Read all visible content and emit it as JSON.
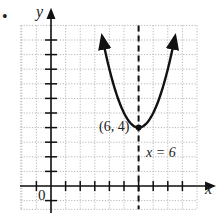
{
  "bullet": "•",
  "chart_data": {
    "type": "line",
    "title": "",
    "xlabel": "x",
    "ylabel": "y",
    "function": "y = (x - 6)^2 + 4",
    "series": [
      {
        "name": "parabola",
        "x": [
          3.5,
          4,
          4.5,
          5,
          5.5,
          6,
          6.5,
          7,
          7.5,
          8,
          8.5
        ],
        "y": [
          10.25,
          8,
          6.25,
          5,
          4.25,
          4,
          4.25,
          5,
          6.25,
          8,
          10.25
        ]
      }
    ],
    "vertex": {
      "x": 6,
      "y": 4,
      "label": "(6, 4)"
    },
    "axis_of_symmetry": {
      "x": 6,
      "label": "x = 6",
      "style": "dashed"
    },
    "origin_label": "0",
    "xlim": [
      -2,
      10
    ],
    "ylim": [
      -1.6,
      11
    ],
    "grid": true,
    "grid_style": "dotted",
    "tick_spacing": 1
  }
}
